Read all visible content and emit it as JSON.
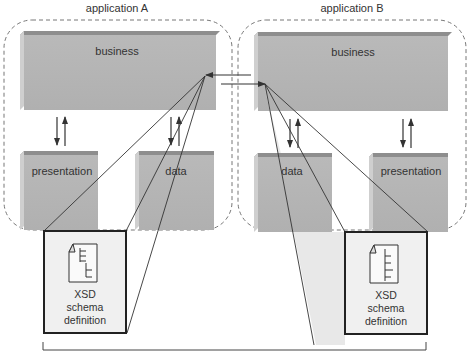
{
  "diagram": {
    "applications": [
      {
        "title": "application A",
        "layers": {
          "business": "business",
          "presentation": "presentation",
          "data": "data"
        },
        "schema": {
          "line1": "XSD",
          "line2": "schema",
          "line3": "definition"
        }
      },
      {
        "title": "application B",
        "layers": {
          "business": "business",
          "presentation": "presentation",
          "data": "data"
        },
        "schema": {
          "line1": "XSD",
          "line2": "schema",
          "line3": "definition"
        }
      }
    ],
    "colors": {
      "block_face": "#b5b5b5",
      "block_top": "#8e8e8e",
      "block_side": "#cfcfcf",
      "container_border": "#777777",
      "schema_fill": "#f0f0f0",
      "schema_border": "#222222",
      "arrow": "#333333",
      "projection_fill": "#e6e6e6"
    }
  }
}
